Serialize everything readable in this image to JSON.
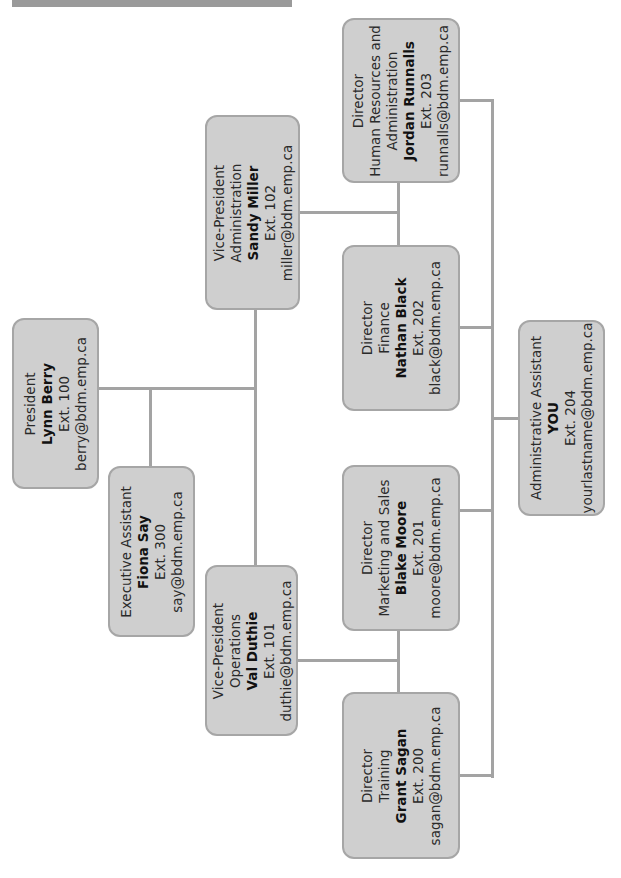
{
  "chart": {
    "orientation": "rotated-90-ccw",
    "colors": {
      "box_fill": "#cfcfcf",
      "box_border": "#a6a6a6",
      "connector": "#a3a3a3",
      "header_bar": "#9a9a9a"
    }
  },
  "nodes": {
    "president": {
      "title": "President",
      "dept": "",
      "name": "Lynn Berry",
      "ext": "Ext. 100",
      "email": "berry@bdm.emp.ca"
    },
    "exec_assistant": {
      "title": "Executive Assistant",
      "dept": "",
      "name": "Fiona Say",
      "ext": "Ext. 300",
      "email": "say@bdm.emp.ca"
    },
    "vp_operations": {
      "title": "Vice-President",
      "dept": "Operations",
      "name": "Val Duthie",
      "ext": "Ext. 101",
      "email": "duthie@bdm.emp.ca"
    },
    "vp_admin": {
      "title": "Vice-President",
      "dept": "Administration",
      "name": "Sandy Miller",
      "ext": "Ext. 102",
      "email": "miller@bdm.emp.ca"
    },
    "dir_hr": {
      "title": "Director",
      "dept": "Human Resources and",
      "dept2": "Administration",
      "name": "Jordan Runnalls",
      "ext": "Ext. 203",
      "email": "runnalls@bdm.emp.ca"
    },
    "dir_finance": {
      "title": "Director",
      "dept": "Finance",
      "name": "Nathan Black",
      "ext": "Ext. 202",
      "email": "black@bdm.emp.ca"
    },
    "dir_marketing": {
      "title": "Director",
      "dept": "Marketing and Sales",
      "name": "Blake Moore",
      "ext": "Ext. 201",
      "email": "moore@bdm.emp.ca"
    },
    "dir_training": {
      "title": "Director",
      "dept": "Training",
      "name": "Grant Sagan",
      "ext": "Ext. 200",
      "email": "sagan@bdm.emp.ca"
    },
    "admin_assistant": {
      "title": "Administrative Assistant",
      "dept": "",
      "name": "YOU",
      "ext": "Ext. 204",
      "email": "yourlastname@bdm.emp.ca"
    }
  }
}
